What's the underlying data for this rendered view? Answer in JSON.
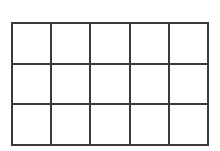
{
  "grid": {
    "rows": 3,
    "cols": 5,
    "line_color": "#3a3a3a",
    "background": "#ffffff",
    "cells": [
      [
        "",
        "",
        "",
        "",
        ""
      ],
      [
        "",
        "",
        "",
        "",
        ""
      ],
      [
        "",
        "",
        "",
        "",
        ""
      ]
    ]
  }
}
